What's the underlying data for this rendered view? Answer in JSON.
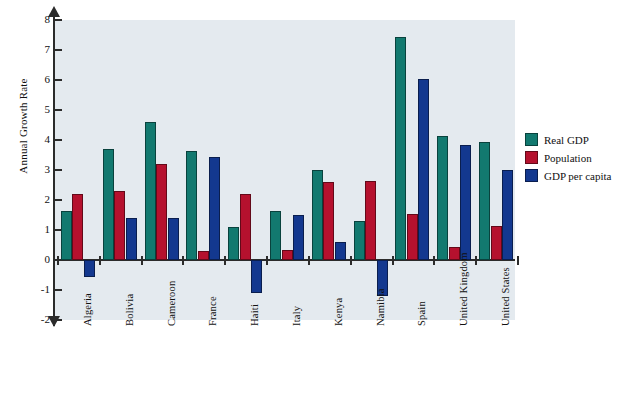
{
  "chart_data": {
    "type": "bar",
    "title": "",
    "xlabel": "",
    "ylabel": "Annual Growth Rate",
    "ylim": [
      -2,
      8
    ],
    "yticks": [
      8,
      7,
      6,
      5,
      4,
      3,
      2,
      1,
      0,
      -1,
      -2
    ],
    "ytick_labels": [
      "8",
      "7",
      "6",
      "5",
      "4",
      "3",
      "2",
      "1",
      "0",
      "-1",
      "-2"
    ],
    "grid": false,
    "legend_position": "right",
    "categories": [
      "Algeria",
      "Bolivia",
      "Cameroon",
      "France",
      "Haiti",
      "Italy",
      "Kenya",
      "Namibia",
      "Spain",
      "United Kingdom",
      "United States"
    ],
    "series": [
      {
        "name": "Real GDP",
        "color": "#12796f",
        "values": [
          1.65,
          3.7,
          4.6,
          3.65,
          1.1,
          1.65,
          3.0,
          1.3,
          7.45,
          4.15,
          3.95
        ]
      },
      {
        "name": "Population",
        "color": "#b5112e",
        "values": [
          2.2,
          2.3,
          3.2,
          0.3,
          2.2,
          0.35,
          2.6,
          2.65,
          1.55,
          0.45,
          1.15
        ]
      },
      {
        "name": "GDP per capita",
        "color": "#13388f",
        "values": [
          -0.55,
          1.4,
          1.4,
          3.45,
          -1.1,
          1.5,
          0.6,
          -1.2,
          6.05,
          3.85,
          3.0
        ]
      }
    ]
  },
  "legend": {
    "items": [
      {
        "label": "Real GDP",
        "color": "#12796f"
      },
      {
        "label": "Population",
        "color": "#b5112e"
      },
      {
        "label": "GDP per capita",
        "color": "#13388f"
      }
    ]
  },
  "axes": {
    "y_title": "Annual Growth Rate"
  },
  "colors": {
    "plot_background": "#e4eaef",
    "page_background": "#ffffff",
    "axis": "#2b2b2b",
    "series_real_gdp": "#12796f",
    "series_population": "#b5112e",
    "series_gdp_per_capita": "#13388f"
  }
}
